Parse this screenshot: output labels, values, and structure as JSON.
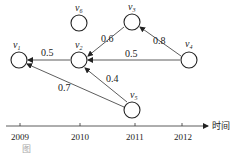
{
  "diagram": {
    "nodes": [
      {
        "id": "v1",
        "label": "v",
        "sub": "1",
        "x": 19,
        "y": 60
      },
      {
        "id": "v2",
        "label": "v",
        "sub": "2",
        "x": 79,
        "y": 60
      },
      {
        "id": "v3",
        "label": "v",
        "sub": "3",
        "x": 132,
        "y": 22
      },
      {
        "id": "v4",
        "label": "v",
        "sub": "4",
        "x": 189,
        "y": 60
      },
      {
        "id": "v5",
        "label": "v",
        "sub": "5",
        "x": 132,
        "y": 110
      },
      {
        "id": "v6",
        "label": "v",
        "sub": "6",
        "x": 79,
        "y": 23
      }
    ],
    "edges": [
      {
        "from": "v2",
        "to": "v1",
        "weight": "0.5"
      },
      {
        "from": "v3",
        "to": "v2",
        "weight": "0.6"
      },
      {
        "from": "v4",
        "to": "v2",
        "weight": "0.5"
      },
      {
        "from": "v4",
        "to": "v3",
        "weight": "0.8"
      },
      {
        "from": "v5",
        "to": "v2",
        "weight": "0.4"
      },
      {
        "from": "v5",
        "to": "v1",
        "weight": "0.7"
      }
    ],
    "axis": {
      "label": "时间",
      "ticks": [
        "2009",
        "2010",
        "2011",
        "2012"
      ]
    },
    "caption": "图"
  }
}
